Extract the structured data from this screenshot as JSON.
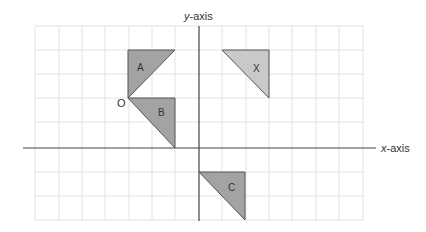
{
  "axes": {
    "x_label_italic": "x",
    "x_label_rest": "-axis",
    "y_label_italic": "y",
    "y_label_rest": "-axis"
  },
  "origin_label": "O",
  "grid": {
    "columns": 14,
    "rows": 8,
    "line_color": "#e2e2e2",
    "axis_color": "#444444"
  },
  "shapes": [
    {
      "label": "A",
      "fill": "#a3a3a3"
    },
    {
      "label": "B",
      "fill": "#a3a3a3"
    },
    {
      "label": "C",
      "fill": "#a3a3a3"
    },
    {
      "label": "X",
      "fill": "#c9c9c9"
    }
  ]
}
